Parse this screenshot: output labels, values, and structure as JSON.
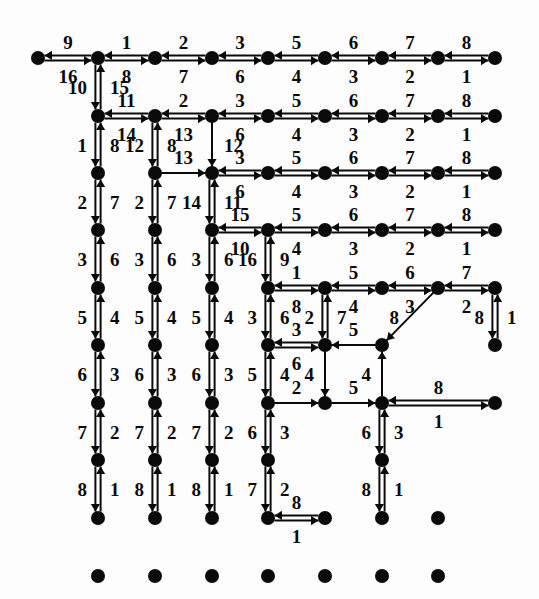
{
  "figure": {
    "title": "",
    "background": "#fdfdfd",
    "ink": "#0a0a0a",
    "width": 539,
    "height": 599
  },
  "chart_data": {
    "type": "diagram",
    "subtype": "directed-graph-grid",
    "title": "",
    "xlabel": "",
    "ylabel": "",
    "node_radius": 7,
    "nodes": [
      {
        "id": "r0c0",
        "x": 38,
        "y": 58
      },
      {
        "id": "r0c1",
        "x": 98,
        "y": 58
      },
      {
        "id": "r0c2",
        "x": 155,
        "y": 58
      },
      {
        "id": "r0c3",
        "x": 212,
        "y": 58
      },
      {
        "id": "r0c4",
        "x": 268,
        "y": 58
      },
      {
        "id": "r0c5",
        "x": 325,
        "y": 58
      },
      {
        "id": "r0c6",
        "x": 382,
        "y": 58
      },
      {
        "id": "r0c7",
        "x": 438,
        "y": 58
      },
      {
        "id": "r0c8",
        "x": 495,
        "y": 58
      },
      {
        "id": "r1c1",
        "x": 98,
        "y": 116
      },
      {
        "id": "r1c2",
        "x": 155,
        "y": 116
      },
      {
        "id": "r1c3",
        "x": 212,
        "y": 116
      },
      {
        "id": "r1c4",
        "x": 268,
        "y": 116
      },
      {
        "id": "r1c5",
        "x": 325,
        "y": 116
      },
      {
        "id": "r1c6",
        "x": 382,
        "y": 116
      },
      {
        "id": "r1c7",
        "x": 438,
        "y": 116
      },
      {
        "id": "r1c8",
        "x": 495,
        "y": 116
      },
      {
        "id": "r2c1",
        "x": 98,
        "y": 173
      },
      {
        "id": "r2c2",
        "x": 155,
        "y": 173
      },
      {
        "id": "r2c3",
        "x": 212,
        "y": 173
      },
      {
        "id": "r2c4",
        "x": 268,
        "y": 173
      },
      {
        "id": "r2c5",
        "x": 325,
        "y": 173
      },
      {
        "id": "r2c6",
        "x": 382,
        "y": 173
      },
      {
        "id": "r2c7",
        "x": 438,
        "y": 173
      },
      {
        "id": "r2c8",
        "x": 495,
        "y": 173
      },
      {
        "id": "r3c1",
        "x": 98,
        "y": 230
      },
      {
        "id": "r3c2",
        "x": 155,
        "y": 230
      },
      {
        "id": "r3c3",
        "x": 212,
        "y": 230
      },
      {
        "id": "r3c4",
        "x": 268,
        "y": 230
      },
      {
        "id": "r3c5",
        "x": 325,
        "y": 230
      },
      {
        "id": "r3c6",
        "x": 382,
        "y": 230
      },
      {
        "id": "r3c7",
        "x": 438,
        "y": 230
      },
      {
        "id": "r3c8",
        "x": 495,
        "y": 230
      },
      {
        "id": "r4c1",
        "x": 98,
        "y": 288
      },
      {
        "id": "r4c2",
        "x": 155,
        "y": 288
      },
      {
        "id": "r4c3",
        "x": 212,
        "y": 288
      },
      {
        "id": "r4c4",
        "x": 268,
        "y": 288
      },
      {
        "id": "r4c5",
        "x": 325,
        "y": 288
      },
      {
        "id": "r4c6",
        "x": 382,
        "y": 288
      },
      {
        "id": "r4c7",
        "x": 438,
        "y": 288
      },
      {
        "id": "r4c8",
        "x": 495,
        "y": 288
      },
      {
        "id": "r5c1",
        "x": 98,
        "y": 345
      },
      {
        "id": "r5c2",
        "x": 155,
        "y": 345
      },
      {
        "id": "r5c3",
        "x": 212,
        "y": 345
      },
      {
        "id": "r5c4",
        "x": 268,
        "y": 345
      },
      {
        "id": "r5c5",
        "x": 325,
        "y": 345
      },
      {
        "id": "r5c6",
        "x": 382,
        "y": 345
      },
      {
        "id": "r5c8",
        "x": 495,
        "y": 345
      },
      {
        "id": "r6c1",
        "x": 98,
        "y": 403
      },
      {
        "id": "r6c2",
        "x": 155,
        "y": 403
      },
      {
        "id": "r6c3",
        "x": 212,
        "y": 403
      },
      {
        "id": "r6c4",
        "x": 268,
        "y": 403
      },
      {
        "id": "r6c5",
        "x": 325,
        "y": 403
      },
      {
        "id": "r6c6",
        "x": 382,
        "y": 403
      },
      {
        "id": "r6c8",
        "x": 495,
        "y": 403
      },
      {
        "id": "r7c1",
        "x": 98,
        "y": 460
      },
      {
        "id": "r7c2",
        "x": 155,
        "y": 460
      },
      {
        "id": "r7c3",
        "x": 212,
        "y": 460
      },
      {
        "id": "r7c4",
        "x": 268,
        "y": 460
      },
      {
        "id": "r7c6",
        "x": 382,
        "y": 460
      },
      {
        "id": "r8c1",
        "x": 98,
        "y": 518
      },
      {
        "id": "r8c2",
        "x": 155,
        "y": 518
      },
      {
        "id": "r8c3",
        "x": 212,
        "y": 518
      },
      {
        "id": "r8c4",
        "x": 268,
        "y": 518
      },
      {
        "id": "r8c5",
        "x": 325,
        "y": 518
      },
      {
        "id": "r8c6",
        "x": 382,
        "y": 518
      },
      {
        "id": "r8c7",
        "x": 438,
        "y": 518
      },
      {
        "id": "r9c1",
        "x": 98,
        "y": 576
      },
      {
        "id": "r9c2",
        "x": 155,
        "y": 576
      },
      {
        "id": "r9c3",
        "x": 212,
        "y": 576
      },
      {
        "id": "r9c4",
        "x": 268,
        "y": 576
      },
      {
        "id": "r9c5",
        "x": 325,
        "y": 576
      },
      {
        "id": "r9c6",
        "x": 382,
        "y": 576
      },
      {
        "id": "r9c7",
        "x": 438,
        "y": 576
      }
    ],
    "edges": [
      {
        "from": "r0c0",
        "to": "r0c1",
        "orient": "h",
        "double": true,
        "fwd": "9",
        "rev": "16"
      },
      {
        "from": "r0c1",
        "to": "r0c2",
        "orient": "h",
        "double": true,
        "fwd": "1",
        "rev": "8"
      },
      {
        "from": "r0c2",
        "to": "r0c3",
        "orient": "h",
        "double": true,
        "fwd": "2",
        "rev": "7"
      },
      {
        "from": "r0c3",
        "to": "r0c4",
        "orient": "h",
        "double": true,
        "fwd": "3",
        "rev": "6"
      },
      {
        "from": "r0c4",
        "to": "r0c5",
        "orient": "h",
        "double": true,
        "fwd": "5",
        "rev": "4"
      },
      {
        "from": "r0c5",
        "to": "r0c6",
        "orient": "h",
        "double": true,
        "fwd": "6",
        "rev": "3"
      },
      {
        "from": "r0c6",
        "to": "r0c7",
        "orient": "h",
        "double": true,
        "fwd": "7",
        "rev": "2"
      },
      {
        "from": "r0c7",
        "to": "r0c8",
        "orient": "h",
        "double": true,
        "fwd": "8",
        "rev": "1"
      },
      {
        "from": "r0c1",
        "to": "r1c1",
        "orient": "v",
        "double": true,
        "fwd": "10",
        "rev": "15"
      },
      {
        "from": "r1c1",
        "to": "r1c2",
        "orient": "h",
        "double": true,
        "fwd": "11",
        "rev": "14"
      },
      {
        "from": "r1c2",
        "to": "r1c3",
        "orient": "h",
        "double": true,
        "fwd": "2",
        "rev": "13"
      },
      {
        "from": "r1c3",
        "to": "r1c4",
        "orient": "h",
        "double": true,
        "fwd": "3",
        "rev": "6"
      },
      {
        "from": "r1c4",
        "to": "r1c5",
        "orient": "h",
        "double": true,
        "fwd": "5",
        "rev": "4"
      },
      {
        "from": "r1c5",
        "to": "r1c6",
        "orient": "h",
        "double": true,
        "fwd": "6",
        "rev": "3"
      },
      {
        "from": "r1c6",
        "to": "r1c7",
        "orient": "h",
        "double": true,
        "fwd": "7",
        "rev": "2"
      },
      {
        "from": "r1c7",
        "to": "r1c8",
        "orient": "h",
        "double": true,
        "fwd": "8",
        "rev": "1"
      },
      {
        "from": "r1c1",
        "to": "r2c1",
        "orient": "v",
        "double": true,
        "fwd": "1",
        "rev": "8"
      },
      {
        "from": "r1c2",
        "to": "r2c2",
        "orient": "v",
        "double": true,
        "fwd": "12",
        "rev": "8"
      },
      {
        "from": "r1c3",
        "to": "r2c3",
        "orient": "v",
        "double": false,
        "fwd": "",
        "rev": "12"
      },
      {
        "from": "r2c2",
        "to": "r2c3",
        "orient": "h",
        "double": false,
        "fwd": "13",
        "rev": ""
      },
      {
        "from": "r2c3",
        "to": "r2c4",
        "orient": "h",
        "double": true,
        "fwd": "3",
        "rev": "6"
      },
      {
        "from": "r2c4",
        "to": "r2c5",
        "orient": "h",
        "double": true,
        "fwd": "5",
        "rev": "4"
      },
      {
        "from": "r2c5",
        "to": "r2c6",
        "orient": "h",
        "double": true,
        "fwd": "6",
        "rev": "3"
      },
      {
        "from": "r2c6",
        "to": "r2c7",
        "orient": "h",
        "double": true,
        "fwd": "7",
        "rev": "2"
      },
      {
        "from": "r2c7",
        "to": "r2c8",
        "orient": "h",
        "double": true,
        "fwd": "8",
        "rev": "1"
      },
      {
        "from": "r2c1",
        "to": "r3c1",
        "orient": "v",
        "double": true,
        "fwd": "2",
        "rev": "7"
      },
      {
        "from": "r2c2",
        "to": "r3c2",
        "orient": "v",
        "double": true,
        "fwd": "2",
        "rev": "7"
      },
      {
        "from": "r2c3",
        "to": "r3c3",
        "orient": "v",
        "double": true,
        "fwd": "14",
        "rev": "11"
      },
      {
        "from": "r3c3",
        "to": "r3c4",
        "orient": "h",
        "double": true,
        "fwd": "15",
        "rev": "10"
      },
      {
        "from": "r3c4",
        "to": "r3c5",
        "orient": "h",
        "double": true,
        "fwd": "5",
        "rev": "4"
      },
      {
        "from": "r3c5",
        "to": "r3c6",
        "orient": "h",
        "double": true,
        "fwd": "6",
        "rev": "3"
      },
      {
        "from": "r3c6",
        "to": "r3c7",
        "orient": "h",
        "double": true,
        "fwd": "7",
        "rev": "2"
      },
      {
        "from": "r3c7",
        "to": "r3c8",
        "orient": "h",
        "double": true,
        "fwd": "8",
        "rev": "1"
      },
      {
        "from": "r3c1",
        "to": "r4c1",
        "orient": "v",
        "double": true,
        "fwd": "3",
        "rev": "6"
      },
      {
        "from": "r3c2",
        "to": "r4c2",
        "orient": "v",
        "double": true,
        "fwd": "3",
        "rev": "6"
      },
      {
        "from": "r3c3",
        "to": "r4c3",
        "orient": "v",
        "double": true,
        "fwd": "3",
        "rev": "6"
      },
      {
        "from": "r3c4",
        "to": "r4c4",
        "orient": "v",
        "double": true,
        "fwd": "16",
        "rev": "9"
      },
      {
        "from": "r4c4",
        "to": "r4c5",
        "orient": "h",
        "double": true,
        "fwd": "1",
        "rev": "8"
      },
      {
        "from": "r4c5",
        "to": "r4c6",
        "orient": "h",
        "double": true,
        "fwd": "5",
        "rev": "4"
      },
      {
        "from": "r4c6",
        "to": "r4c7",
        "orient": "h",
        "double": true,
        "fwd": "6",
        "rev": "3"
      },
      {
        "from": "r4c7",
        "to": "r4c8",
        "orient": "h",
        "double": true,
        "fwd": "7",
        "rev": "2"
      },
      {
        "from": "r4c1",
        "to": "r5c1",
        "orient": "v",
        "double": true,
        "fwd": "5",
        "rev": "4"
      },
      {
        "from": "r4c2",
        "to": "r5c2",
        "orient": "v",
        "double": true,
        "fwd": "5",
        "rev": "4"
      },
      {
        "from": "r4c3",
        "to": "r5c3",
        "orient": "v",
        "double": true,
        "fwd": "5",
        "rev": "4"
      },
      {
        "from": "r4c4",
        "to": "r5c4",
        "orient": "v",
        "double": true,
        "fwd": "3",
        "rev": "6"
      },
      {
        "from": "r4c5",
        "to": "r5c5",
        "orient": "v",
        "double": true,
        "fwd": "2",
        "rev": "7"
      },
      {
        "from": "r4c7",
        "to": "r5c6",
        "orient": "v",
        "double": false,
        "fwd": "8",
        "rev": ""
      },
      {
        "from": "r4c8",
        "to": "r5c8",
        "orient": "v",
        "double": true,
        "fwd": "8",
        "rev": "1"
      },
      {
        "from": "r5c5",
        "to": "r5c4",
        "orient": "h",
        "double": true,
        "fwd": "3",
        "rev": "6"
      },
      {
        "from": "r5c6",
        "to": "r5c5",
        "orient": "h",
        "double": false,
        "fwd": "5",
        "rev": ""
      },
      {
        "from": "r5c1",
        "to": "r6c1",
        "orient": "v",
        "double": true,
        "fwd": "6",
        "rev": "3"
      },
      {
        "from": "r5c2",
        "to": "r6c2",
        "orient": "v",
        "double": true,
        "fwd": "6",
        "rev": "3"
      },
      {
        "from": "r5c3",
        "to": "r6c3",
        "orient": "v",
        "double": true,
        "fwd": "6",
        "rev": "3"
      },
      {
        "from": "r5c4",
        "to": "r6c4",
        "orient": "v",
        "double": true,
        "fwd": "5",
        "rev": "4"
      },
      {
        "from": "r5c5",
        "to": "r6c5",
        "orient": "v",
        "double": false,
        "fwd": "4",
        "rev": ""
      },
      {
        "from": "r6c6",
        "to": "r5c6",
        "orient": "v",
        "double": false,
        "fwd": "4",
        "rev": ""
      },
      {
        "from": "r6c4",
        "to": "r6c5",
        "orient": "h",
        "double": false,
        "fwd": "2",
        "rev": ""
      },
      {
        "from": "r6c5",
        "to": "r6c6",
        "orient": "h",
        "double": false,
        "fwd": "5",
        "rev": ""
      },
      {
        "from": "r6c6",
        "to": "r6c8",
        "orient": "h",
        "double": true,
        "fwd": "8",
        "rev": "1"
      },
      {
        "from": "r6c1",
        "to": "r7c1",
        "orient": "v",
        "double": true,
        "fwd": "7",
        "rev": "2"
      },
      {
        "from": "r6c2",
        "to": "r7c2",
        "orient": "v",
        "double": true,
        "fwd": "7",
        "rev": "2"
      },
      {
        "from": "r6c3",
        "to": "r7c3",
        "orient": "v",
        "double": true,
        "fwd": "7",
        "rev": "2"
      },
      {
        "from": "r6c4",
        "to": "r7c4",
        "orient": "v",
        "double": true,
        "fwd": "6",
        "rev": "3"
      },
      {
        "from": "r6c6",
        "to": "r7c6",
        "orient": "v",
        "double": true,
        "fwd": "6",
        "rev": "3"
      },
      {
        "from": "r7c4",
        "to": "r7c5",
        "orient": "h",
        "double": true,
        "fwd": "7",
        "rev": "2"
      },
      {
        "from": "r7c6",
        "to": "r7c7",
        "orient": "h",
        "double": true,
        "fwd": "7",
        "rev": "2"
      },
      {
        "from": "r7c1",
        "to": "r8c1",
        "orient": "v",
        "double": true,
        "fwd": "8",
        "rev": "1"
      },
      {
        "from": "r7c2",
        "to": "r8c2",
        "orient": "v",
        "double": true,
        "fwd": "8",
        "rev": "1"
      },
      {
        "from": "r7c3",
        "to": "r8c3",
        "orient": "v",
        "double": true,
        "fwd": "8",
        "rev": "1"
      },
      {
        "from": "r7c4",
        "to": "r8c4",
        "orient": "v",
        "double": true,
        "fwd": "7",
        "rev": "2"
      },
      {
        "from": "r7c5",
        "to": "r8c5",
        "orient": "v",
        "double": true,
        "fwd": "8",
        "rev": "1"
      },
      {
        "from": "r7c6",
        "to": "r8c6",
        "orient": "v",
        "double": true,
        "fwd": "8",
        "rev": "1"
      },
      {
        "from": "r7c7",
        "to": "r8c7",
        "orient": "v",
        "double": true,
        "fwd": "8",
        "rev": "1"
      },
      {
        "from": "r8c4",
        "to": "r8c5",
        "orient": "h",
        "double": true,
        "fwd": "8",
        "rev": "1"
      }
    ],
    "label_values_top_row": [
      "9",
      "1",
      "2",
      "3",
      "5",
      "6",
      "7",
      "8"
    ],
    "label_values_top_row_reverse": [
      "16",
      "8",
      "7",
      "6",
      "4",
      "3",
      "2",
      "1"
    ],
    "legend": [],
    "annotations": []
  }
}
